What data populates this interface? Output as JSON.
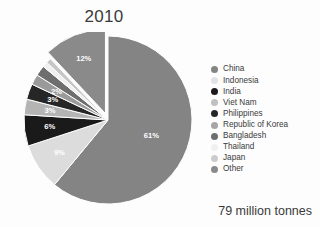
{
  "chart": {
    "title": "2010",
    "footnote": "79 million tonnes"
  },
  "chart_data": {
    "type": "pie",
    "title": "2010",
    "subtitle": "",
    "xlabel": "",
    "ylabel": "",
    "total_label": "79 million tonnes",
    "units": "million tonnes",
    "total_value": 79,
    "legend_position": "right",
    "grid": false,
    "explode_slice": "Other",
    "start_angle_deg": -90,
    "direction": "clockwise",
    "categories": [
      "China",
      "Indonesia",
      "India",
      "Viet Nam",
      "Philippines",
      "Republic of Korea",
      "Bangladesh",
      "Thailand",
      "Japan",
      "Other"
    ],
    "values": [
      61,
      9,
      6,
      3,
      3,
      2,
      2,
      1,
      1,
      12
    ],
    "value_labels": [
      "61%",
      "9%",
      "6%",
      "3%",
      "3%",
      "2%",
      "",
      "",
      "",
      "12%"
    ],
    "colors": [
      "#848484",
      "#dcdcdc",
      "#1a1a1a",
      "#b4b4b4",
      "#262626",
      "#9a9a9a",
      "#6e6e6e",
      "#f0f0f0",
      "#c6c6c6",
      "#8a8a8a"
    ],
    "slices": [
      {
        "label": "China",
        "value": 61,
        "display": "61%",
        "color": "#848484"
      },
      {
        "label": "Indonesia",
        "value": 9,
        "display": "9%",
        "color": "#dcdcdc"
      },
      {
        "label": "India",
        "value": 6,
        "display": "6%",
        "color": "#1a1a1a"
      },
      {
        "label": "Viet Nam",
        "value": 3,
        "display": "3%",
        "color": "#b4b4b4"
      },
      {
        "label": "Philippines",
        "value": 3,
        "display": "3%",
        "color": "#262626"
      },
      {
        "label": "Republic of Korea",
        "value": 2,
        "display": "2%",
        "color": "#9a9a9a"
      },
      {
        "label": "Bangladesh",
        "value": 2,
        "display": "",
        "color": "#6e6e6e"
      },
      {
        "label": "Thailand",
        "value": 1,
        "display": "",
        "color": "#f0f0f0"
      },
      {
        "label": "Japan",
        "value": 1,
        "display": "",
        "color": "#c6c6c6"
      },
      {
        "label": "Other",
        "value": 12,
        "display": "12%",
        "color": "#8a8a8a"
      }
    ]
  },
  "legend": {
    "items": [
      {
        "label": "China",
        "color": "#848484"
      },
      {
        "label": "Indonesia",
        "color": "#e2e2e2"
      },
      {
        "label": "India",
        "color": "#1a1a1a"
      },
      {
        "label": "Viet Nam",
        "color": "#c0c0c0"
      },
      {
        "label": "Philippines",
        "color": "#262626"
      },
      {
        "label": "Republic of Korea",
        "color": "#a6a6a6"
      },
      {
        "label": "Bangladesh",
        "color": "#6e6e6e"
      },
      {
        "label": "Thailand",
        "color": "#f0f0f0"
      },
      {
        "label": "Japan",
        "color": "#cccccc"
      },
      {
        "label": "Other",
        "color": "#8a8a8a"
      }
    ]
  }
}
